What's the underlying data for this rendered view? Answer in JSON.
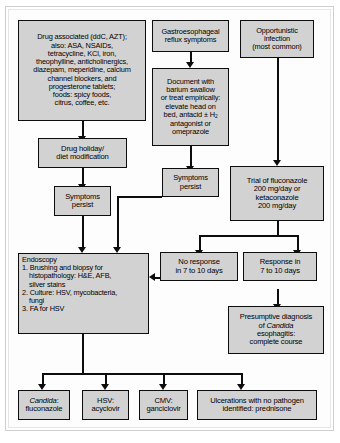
{
  "diagram": {
    "type": "flowchart",
    "box_fill": "#d2d2d2",
    "box_border": "#0d0d0d",
    "background": "#ffffff"
  },
  "nodes": {
    "drug_associated": {
      "lines": [
        "Drug associated (ddC, AZT);",
        "also: ASA, NSAIDs,",
        "tetracycline, KCl, iron,",
        "theophylline, anticholinergics,",
        "diazepam, meperidine, calcium",
        "channel blockers, and",
        "progesterone tablets;",
        "foods: spicy foods,",
        "citrus, coffee, etc."
      ]
    },
    "gerd_symptoms": {
      "lines": [
        "Gastroesophageal",
        "reflux symptoms"
      ]
    },
    "opportunistic_infection": {
      "lines": [
        "Opportunistic",
        "infection",
        "(most common)"
      ]
    },
    "document_barium": {
      "lines": [
        "Document with",
        "barium swallow",
        "or treat empirically:",
        "elevate head on",
        "bed, antacid ± H2",
        "antagonist or",
        "omeprazole"
      ],
      "subscript_note": "H2 rendered with subscript 2"
    },
    "drug_holiday": {
      "lines": [
        "Drug holiday/",
        "diet modification"
      ]
    },
    "symptoms_persist_left": {
      "lines": [
        "Symptoms",
        "persist"
      ]
    },
    "symptoms_persist_mid": {
      "lines": [
        "Symptoms",
        "persist"
      ]
    },
    "trial_fluconazole": {
      "lines": [
        "Trial of fluconazole",
        "200 mg/day or",
        "ketaconazole",
        "200 mg/day"
      ]
    },
    "endoscopy": {
      "heading": "Endoscopy",
      "items": [
        {
          "num": "1.",
          "lines": [
            "Brushing and biopsy for",
            "histopathology: H&E, AFB,",
            "silver stains"
          ]
        },
        {
          "num": "2.",
          "lines": [
            "Culture: HSV, mycobacteria,",
            "fungi"
          ]
        },
        {
          "num": "3.",
          "lines": [
            "FA for HSV"
          ]
        }
      ]
    },
    "no_response": {
      "lines": [
        "No response",
        "in 7 to 10 days"
      ]
    },
    "response": {
      "lines": [
        "Response in",
        "7 to 10 days"
      ]
    },
    "presumptive_diagnosis": {
      "line1": "Presumptive diagnosis",
      "line2_pre": "of ",
      "line2_italic": "Candida",
      "line3": "esophagitis:",
      "line4": "complete course"
    },
    "candida_treatment": {
      "line1_italic": "Candida",
      "line1_post": ":",
      "line2": "fluconazole"
    },
    "hsv_treatment": {
      "lines": [
        "HSV:",
        "acyclovir"
      ]
    },
    "cmv_treatment": {
      "lines": [
        "CMV:",
        "ganciclovir"
      ]
    },
    "ulcerations_treatment": {
      "lines": [
        "Ulcerations with no pathogen",
        "identified: prednisone"
      ]
    }
  }
}
